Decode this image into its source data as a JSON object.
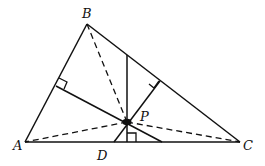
{
  "diagram": {
    "type": "geometry",
    "colors": {
      "stroke": "#111111",
      "background": "#ffffff"
    },
    "labels": {
      "A": "A",
      "B": "B",
      "C": "C",
      "D": "D",
      "P": "P"
    },
    "points": {
      "A": [
        25,
        142
      ],
      "B": [
        87,
        24
      ],
      "C": [
        240,
        142
      ],
      "P": [
        127,
        122
      ],
      "D": [
        114,
        142
      ]
    },
    "solid_segments": [
      [
        "A",
        "B"
      ],
      [
        "B",
        "C"
      ],
      [
        "A",
        "C"
      ]
    ],
    "dashed_segments": [
      [
        "P",
        "A"
      ],
      [
        "P",
        "B"
      ],
      [
        "P",
        "C"
      ]
    ],
    "right_angle_marks": [
      "foot on AB",
      "foot on BC",
      "foot on AC"
    ]
  }
}
